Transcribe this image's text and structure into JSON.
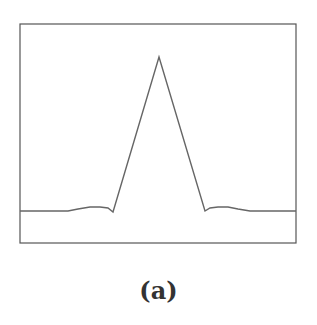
{
  "figure": {
    "caption": "(a)"
  },
  "chart_data": {
    "type": "line",
    "title": "",
    "xlabel": "",
    "ylabel": "",
    "grid": false,
    "legend": null,
    "frame": {
      "x0": 20,
      "y0": 24,
      "x1": 296,
      "y1": 243
    },
    "series": [
      {
        "name": "profile",
        "color": "#666666",
        "points_px": [
          [
            20,
            211
          ],
          [
            68,
            211
          ],
          [
            78,
            209
          ],
          [
            90,
            207
          ],
          [
            100,
            207
          ],
          [
            108,
            208
          ],
          [
            113,
            212
          ],
          [
            159,
            57
          ],
          [
            205,
            211
          ],
          [
            210,
            208
          ],
          [
            218,
            207
          ],
          [
            228,
            207
          ],
          [
            238,
            209
          ],
          [
            250,
            211
          ],
          [
            296,
            211
          ]
        ]
      }
    ]
  }
}
